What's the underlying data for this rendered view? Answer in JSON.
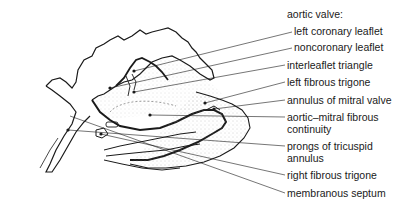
{
  "diagram": {
    "heading": "aortic valve:",
    "labels": [
      {
        "id": "left-coronary-leaflet",
        "text": "left coronary leaflet",
        "x": 294,
        "y": 25
      },
      {
        "id": "noncoronary-leaflet",
        "text": "noncoronary leaflet",
        "x": 294,
        "y": 41
      },
      {
        "id": "interleaflet-triangle",
        "text": "interleaflet triangle",
        "x": 287,
        "y": 59
      },
      {
        "id": "left-fibrous-trigone",
        "text": "left fibrous trigone",
        "x": 287,
        "y": 76
      },
      {
        "id": "annulus-of-mitral-valve",
        "text": "annulus of mitral valve",
        "x": 287,
        "y": 94
      },
      {
        "id": "aortic-mitral-fibrous-continuity",
        "text": "aortic–mitral fibrous",
        "text2": "continuity",
        "x": 287,
        "y": 111
      },
      {
        "id": "prongs-of-tricuspid-annulus",
        "text": "prongs of tricuspid",
        "text2": "annulus",
        "x": 287,
        "y": 140
      },
      {
        "id": "right-fibrous-trigone",
        "text": "right fibrous trigone",
        "x": 287,
        "y": 169
      },
      {
        "id": "membranous-septum",
        "text": "membranous septum",
        "x": 287,
        "y": 187
      }
    ]
  },
  "colors": {
    "ink": "#1a1a1a",
    "background": "#ffffff",
    "stipple": "#9a9a9a"
  }
}
